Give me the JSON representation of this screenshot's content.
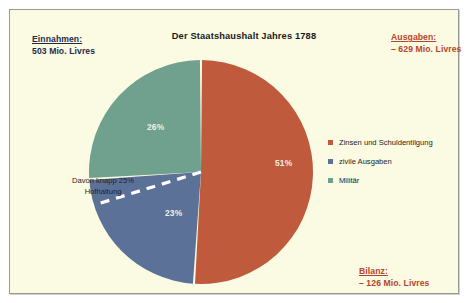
{
  "figure": {
    "background_color": "#fbfae2",
    "frame_color": "#9a9a92"
  },
  "title": "Der Staatshaushalt Jahres 1788",
  "income": {
    "heading": "Einnahmen:",
    "value": "503 Mio. Livres",
    "color": "#1d2a4a"
  },
  "expenses": {
    "heading": "Ausgaben:",
    "value": "– 629 Mio. Livres",
    "color": "#b5442c"
  },
  "balance": {
    "heading": "Bilanz:",
    "value": "– 126 Mio. Livres",
    "color": "#b5442c"
  },
  "annotation": {
    "line1": "Davon knapp 25%",
    "line2": "Hofhaltung"
  },
  "legend": {
    "items": [
      {
        "label": "Zinsen und Schuldentilgung",
        "color": "#bf5a3c"
      },
      {
        "label": "zivile Ausgaben",
        "color": "#5b7197"
      },
      {
        "label": "Militär",
        "color": "#70a08e"
      }
    ]
  },
  "chart_data": {
    "type": "pie",
    "title": "Der Staatshaushalt Jahres 1788",
    "categories": [
      "Zinsen und Schuldentilgung",
      "zivile Ausgaben",
      "Militär"
    ],
    "values": [
      51,
      23,
      26
    ],
    "value_labels": [
      "51%",
      "23%",
      "26%"
    ],
    "colors": [
      "#bf5a3c",
      "#5b7197",
      "#70a08e"
    ],
    "unit": "percent",
    "legend_position": "right",
    "grid": false,
    "start_angle_deg": 0,
    "direction": "clockwise",
    "annotations": [
      {
        "text": "Davon knapp 25% Hofhaltung",
        "attached_to": "zivile Ausgaben",
        "style": "dashed-white-line"
      },
      {
        "text": "Einnahmen: 503 Mio. Livres"
      },
      {
        "text": "Ausgaben: – 629 Mio. Livres"
      },
      {
        "text": "Bilanz: – 126 Mio. Livres"
      }
    ]
  }
}
